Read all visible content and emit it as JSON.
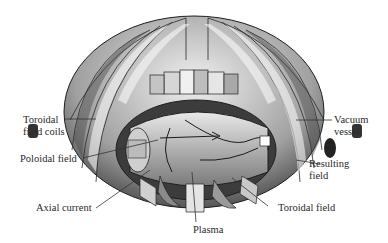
{
  "figure": {
    "labels": {
      "toroidal_field_coils_line1": "Toroidal",
      "toroidal_field_coils_line2": "field coils",
      "poloidal_field": "Poloidal field",
      "axial_current": "Axial current",
      "plasma": "Plasma",
      "toroidal_field": "Toroidal field",
      "resulting_field_line1": "Resulting",
      "resulting_field_line2": "field",
      "vacuum_vessel_line1": "Vacuum",
      "vacuum_vessel_line2": "vessel"
    },
    "colors": {
      "coil_light": "#e6e6e6",
      "coil_mid": "#a8a8a8",
      "coil_dark": "#505050",
      "outline": "#1e1e1e",
      "leader_line": "#333333"
    }
  }
}
